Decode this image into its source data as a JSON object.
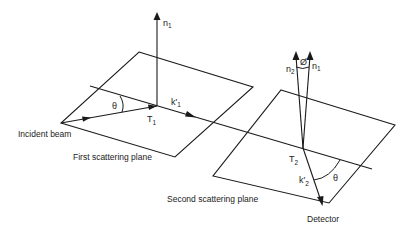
{
  "diagram": {
    "colors": {
      "stroke": "#1a1a1a",
      "text": "#222222",
      "background": "#ffffff"
    },
    "labels": {
      "incident_beam": "Incident beam",
      "first_plane": "First scattering plane",
      "second_plane": "Second scattering plane",
      "detector": "Detector"
    },
    "symbols": {
      "n1_top": {
        "base": "n",
        "sub": "1"
      },
      "k1": {
        "base": "k'",
        "sub": "1"
      },
      "t1": {
        "base": "T",
        "sub": "1"
      },
      "theta1": "θ",
      "n2": {
        "base": "n",
        "sub": "2"
      },
      "n1_second": {
        "base": "n",
        "sub": "1"
      },
      "phi": "Ø",
      "t2": {
        "base": "T",
        "sub": "2"
      },
      "k2": {
        "base": "k'",
        "sub": "2"
      },
      "theta2": "θ"
    }
  }
}
